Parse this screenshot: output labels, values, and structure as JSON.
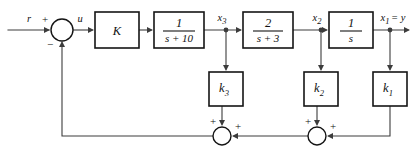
{
  "diagram": {
    "type": "control-system-block-diagram",
    "background_color": "#ffffff",
    "line_color": "#3c3c3c",
    "block_border_color": "#141414",
    "text_color": "#111111"
  },
  "signals": {
    "reference": "r",
    "control": "u",
    "state3": "x",
    "state3_sub": "3",
    "state2": "x",
    "state2_sub": "2",
    "output": "x",
    "output_sub": "1",
    "output_equals": "= y"
  },
  "blocks": [
    {
      "name": "gain-K",
      "label": "K",
      "kind": "gain",
      "x": 95,
      "y": 12,
      "w": 44,
      "h": 36
    },
    {
      "name": "plant-pole-10",
      "kind": "transfer-function",
      "numerator": "1",
      "denominator": "s + 10",
      "x": 154,
      "y": 12,
      "w": 50,
      "h": 36
    },
    {
      "name": "plant-pole-3",
      "kind": "transfer-function",
      "numerator": "2",
      "denominator": "s + 3",
      "x": 243,
      "y": 12,
      "w": 50,
      "h": 36
    },
    {
      "name": "integrator",
      "kind": "transfer-function",
      "numerator": "1",
      "denominator": "s",
      "x": 329,
      "y": 12,
      "w": 44,
      "h": 36
    }
  ],
  "feedback_gains": [
    {
      "name": "feedback-gain-k3",
      "label": "k",
      "subscript": "3",
      "x": 209,
      "y": 72,
      "w": 34,
      "h": 34
    },
    {
      "name": "feedback-gain-k2",
      "label": "k",
      "subscript": "2",
      "x": 304,
      "y": 72,
      "w": 34,
      "h": 34
    },
    {
      "name": "feedback-gain-k1",
      "label": "k",
      "subscript": "1",
      "x": 373,
      "y": 72,
      "w": 34,
      "h": 34
    }
  ],
  "summing_junctions": [
    {
      "name": "error-summing-junction",
      "cx": 62,
      "cy": 30,
      "r": 11,
      "signs": [
        {
          "text": "+",
          "x": 45,
          "y": 22,
          "for": "reference-input"
        },
        {
          "text": "−",
          "x": 50,
          "y": 45,
          "for": "feedback-input"
        }
      ]
    },
    {
      "name": "feedback-summing-junction-left",
      "cx": 222,
      "cy": 136,
      "r": 9,
      "signs": [
        {
          "text": "+",
          "x": 213,
          "y": 123,
          "for": "k3-input"
        },
        {
          "text": "+",
          "x": 237,
          "y": 128,
          "for": "right-input"
        }
      ]
    },
    {
      "name": "feedback-summing-junction-right",
      "cx": 317,
      "cy": 136,
      "r": 9,
      "signs": [
        {
          "text": "+",
          "x": 308,
          "y": 123,
          "for": "k2-input"
        },
        {
          "text": "+",
          "x": 332,
          "y": 128,
          "for": "k1-input"
        }
      ]
    }
  ],
  "tap_nodes": [
    {
      "name": "tap-x3",
      "cx": 226,
      "cy": 30
    },
    {
      "name": "tap-x2",
      "cx": 321,
      "cy": 30
    },
    {
      "name": "tap-x1",
      "cx": 390,
      "cy": 30
    }
  ]
}
